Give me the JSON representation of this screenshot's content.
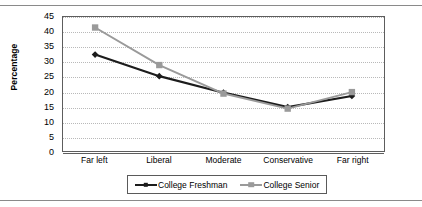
{
  "chart_data": {
    "type": "line",
    "title": "",
    "xlabel": "",
    "ylabel": "Percentage",
    "ylim": [
      0,
      45
    ],
    "yticks": [
      0,
      5,
      10,
      15,
      20,
      25,
      30,
      35,
      40,
      45
    ],
    "grid": true,
    "legend_position": "bottom",
    "categories": [
      "Far left",
      "Liberal",
      "Moderate",
      "Conservative",
      "Far right"
    ],
    "series": [
      {
        "name": "College Freshman",
        "color": "#1c1c1c",
        "marker": "diamond",
        "values": [
          32.5,
          25.3,
          19.8,
          15.0,
          18.7
        ]
      },
      {
        "name": "College Senior",
        "color": "#9a9a9a",
        "marker": "square",
        "values": [
          41.5,
          29.0,
          19.5,
          14.5,
          20.0
        ]
      }
    ]
  },
  "axes": {
    "y_title": "Percentage"
  },
  "colors": {
    "freshman": "#1c1c1c",
    "senior": "#9a9a9a",
    "gridline": "#b9b9b9",
    "frame": "#5d5d5d",
    "rule": "#8a8a8a"
  }
}
